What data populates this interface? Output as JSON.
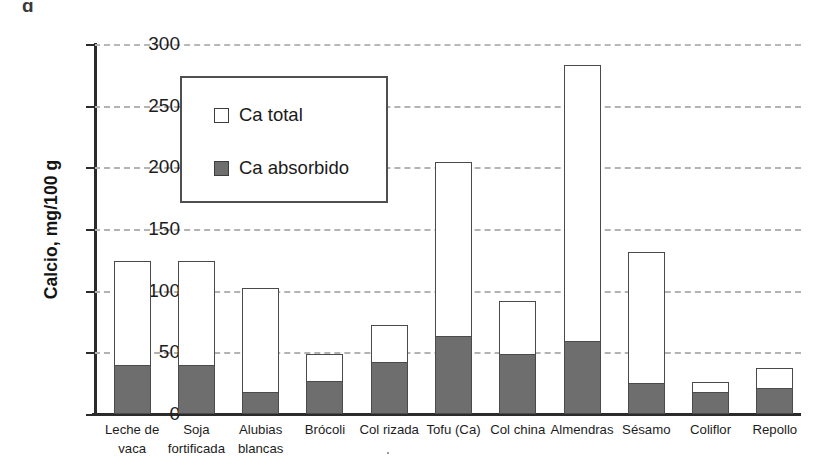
{
  "figure": {
    "top_partial_text": "g",
    "stray_mark": "."
  },
  "axis": {
    "y_title": "Calcio, mg/100 g",
    "y_ticks": [
      "300",
      "250",
      "200",
      "150",
      "100",
      "50",
      "0"
    ]
  },
  "legend": {
    "entries": [
      {
        "label": "Ca total",
        "swatch": "open-square-white",
        "color": "#ffffff"
      },
      {
        "label": "Ca absorbido",
        "swatch": "filled-square-gray",
        "color": "#6e6e6e"
      }
    ]
  },
  "chart_data": {
    "type": "bar",
    "title": "",
    "xlabel": "",
    "ylabel": "Calcio, mg/100 g",
    "ylim": [
      0,
      300
    ],
    "ytick_step": 50,
    "grid": true,
    "grid_style": "dashed-horizontal",
    "legend_position": "inside-upper-left",
    "stacked_overlay": true,
    "categories": [
      "Leche de vaca",
      "Soja fortificada",
      "Alubias blancas",
      "Brócoli",
      "Col rizada",
      "Tofu (Ca)",
      "Col china",
      "Almendras",
      "Sésamo",
      "Coliflor",
      "Repollo"
    ],
    "category_lines": [
      [
        "Leche de",
        "vaca"
      ],
      [
        "Soja",
        "fortificada"
      ],
      [
        "Alubias",
        "blancas"
      ],
      [
        "Brócoli",
        ""
      ],
      [
        "Col rizada",
        ""
      ],
      [
        "Tofu (Ca)",
        ""
      ],
      [
        "Col china",
        ""
      ],
      [
        "Almendras",
        ""
      ],
      [
        "Sésamo",
        ""
      ],
      [
        "Coliflor",
        ""
      ],
      [
        "Repollo",
        ""
      ]
    ],
    "series": [
      {
        "name": "Ca total",
        "values": [
          124,
          124,
          102,
          49,
          72,
          204,
          92,
          283,
          131,
          26,
          37
        ]
      },
      {
        "name": "Ca absorbido",
        "values": [
          40,
          40,
          18,
          27,
          42,
          63,
          49,
          59,
          25,
          18,
          21
        ]
      }
    ]
  },
  "colors": {
    "bar_total_fill": "#ffffff",
    "bar_absorbed_fill": "#6e6e6e",
    "bar_outline": "#4a4a4a",
    "gridline": "#b3b3b3",
    "axis": "#2b2b2b"
  }
}
